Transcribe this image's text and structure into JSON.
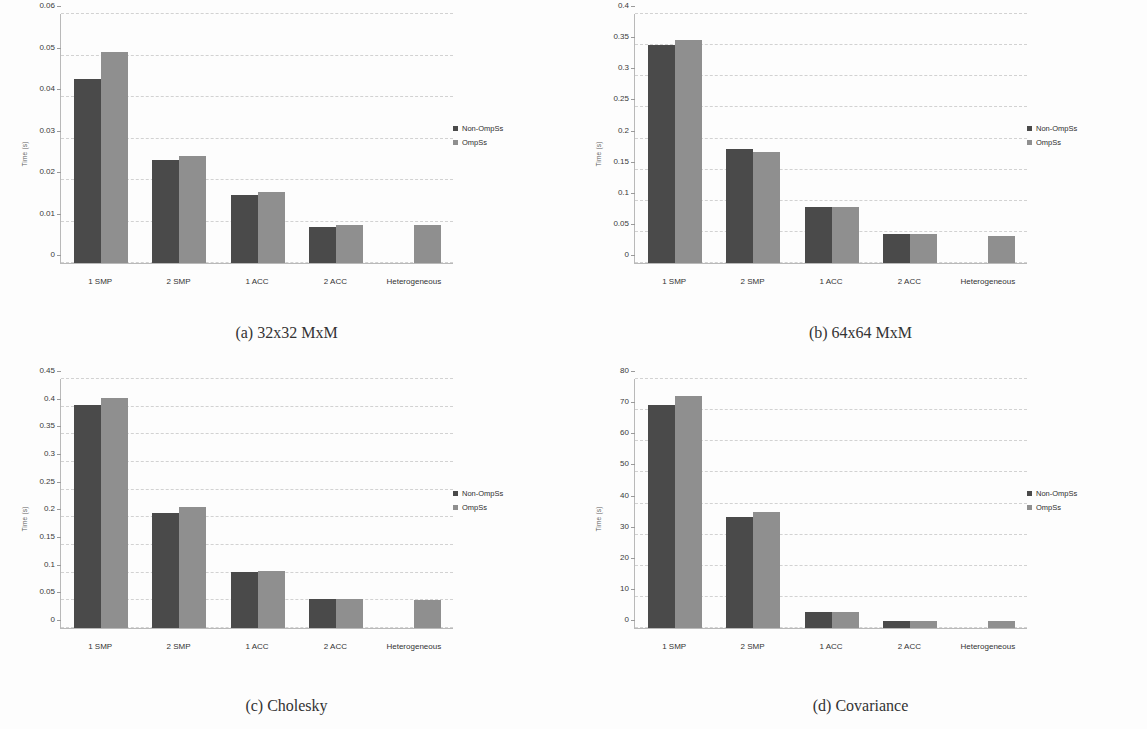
{
  "figure": {
    "colors": {
      "non_ompss": "#4a4a4a",
      "ompss": "#8f8f8f",
      "grid": "#d2d2d2",
      "axis": "#b9b9b9"
    },
    "legend": {
      "entries": [
        "Non-OmpSs",
        "OmpSs"
      ]
    },
    "ylabel": "Time (s)",
    "categories": [
      "1 SMP",
      "2 SMP",
      "1 ACC",
      "2 ACC",
      "Heterogeneous"
    ]
  },
  "panels": {
    "a": {
      "caption": "(a) 32x32 MxM",
      "yticks": [
        "0",
        "0.01",
        "0.02",
        "0.03",
        "0.04",
        "0.05",
        "0.06"
      ],
      "legend": [
        "Non-OmpSs",
        "OmpSs"
      ],
      "ylabel": "Time (s)",
      "categories": [
        "1 SMP",
        "2 SMP",
        "1 ACC",
        "2 ACC",
        "Heterogeneous"
      ]
    },
    "b": {
      "caption": "(b) 64x64 MxM",
      "yticks": [
        "0",
        "0.05",
        "0.1",
        "0.15",
        "0.2",
        "0.25",
        "0.3",
        "0.35",
        "0.4"
      ],
      "legend": [
        "Non-OmpSs",
        "OmpSs"
      ],
      "ylabel": "Time (s)",
      "categories": [
        "1 SMP",
        "2 SMP",
        "1 ACC",
        "2 ACC",
        "Heterogeneous"
      ]
    },
    "c": {
      "caption": "(c) Cholesky",
      "yticks": [
        "0",
        "0.05",
        "0.1",
        "0.15",
        "0.2",
        "0.25",
        "0.3",
        "0.35",
        "0.4",
        "0.45"
      ],
      "legend": [
        "Non-OmpSs",
        "OmpSs"
      ],
      "ylabel": "Time (s)",
      "categories": [
        "1 SMP",
        "2 SMP",
        "1 ACC",
        "2 ACC",
        "Heterogeneous"
      ]
    },
    "d": {
      "caption": "(d) Covariance",
      "yticks": [
        "0",
        "10",
        "20",
        "30",
        "40",
        "50",
        "60",
        "70",
        "80"
      ],
      "legend": [
        "Non-OmpSs",
        "OmpSs"
      ],
      "ylabel": "Time (s)",
      "categories": [
        "1 SMP",
        "2 SMP",
        "1 ACC",
        "2 ACC",
        "Heterogeneous"
      ]
    }
  },
  "chart_data": [
    {
      "id": "a",
      "type": "bar",
      "title": "(a) 32x32 MxM",
      "xlabel": "",
      "ylabel": "Time (s)",
      "ylim": [
        0,
        0.06
      ],
      "ytick_values": [
        0,
        0.01,
        0.02,
        0.03,
        0.04,
        0.05,
        0.06
      ],
      "grid": true,
      "legend_position": "right",
      "categories": [
        "1 SMP",
        "2 SMP",
        "1 ACC",
        "2 ACC",
        "Heterogeneous"
      ],
      "series": [
        {
          "name": "Non-OmpSs",
          "color": "#4a4a4a",
          "values": [
            0.0444,
            0.0248,
            0.0164,
            0.0086,
            null
          ]
        },
        {
          "name": "OmpSs",
          "color": "#8f8f8f",
          "values": [
            0.0509,
            0.0259,
            0.017,
            0.0092,
            0.0092
          ]
        }
      ]
    },
    {
      "id": "b",
      "type": "bar",
      "title": "(b) 64x64 MxM",
      "xlabel": "",
      "ylabel": "Time (s)",
      "ylim": [
        0,
        0.4
      ],
      "ytick_values": [
        0,
        0.05,
        0.1,
        0.15,
        0.2,
        0.25,
        0.3,
        0.35,
        0.4
      ],
      "grid": true,
      "legend_position": "right",
      "categories": [
        "1 SMP",
        "2 SMP",
        "1 ACC",
        "2 ACC",
        "Heterogeneous"
      ],
      "series": [
        {
          "name": "Non-OmpSs",
          "color": "#4a4a4a",
          "values": [
            0.351,
            0.183,
            0.0905,
            0.0465,
            null
          ]
        },
        {
          "name": "OmpSs",
          "color": "#8f8f8f",
          "values": [
            0.359,
            0.179,
            0.0905,
            0.0465,
            0.0435
          ]
        }
      ]
    },
    {
      "id": "c",
      "type": "bar",
      "title": "(c) Cholesky",
      "xlabel": "",
      "ylabel": "Time (s)",
      "ylim": [
        0,
        0.45
      ],
      "ytick_values": [
        0,
        0.05,
        0.1,
        0.15,
        0.2,
        0.25,
        0.3,
        0.35,
        0.4,
        0.45
      ],
      "grid": true,
      "legend_position": "right",
      "categories": [
        "1 SMP",
        "2 SMP",
        "1 ACC",
        "2 ACC",
        "Heterogeneous"
      ],
      "series": [
        {
          "name": "Non-OmpSs",
          "color": "#4a4a4a",
          "values": [
            0.403,
            0.207,
            0.101,
            0.0525,
            null
          ]
        },
        {
          "name": "OmpSs",
          "color": "#8f8f8f",
          "values": [
            0.416,
            0.218,
            0.1025,
            0.0525,
            0.0505
          ]
        }
      ]
    },
    {
      "id": "d",
      "type": "bar",
      "title": "(d) Covariance",
      "xlabel": "",
      "ylabel": "Time (s)",
      "ylim": [
        0,
        80
      ],
      "ytick_values": [
        0,
        10,
        20,
        30,
        40,
        50,
        60,
        70,
        80
      ],
      "grid": true,
      "legend_position": "right",
      "categories": [
        "1 SMP",
        "2 SMP",
        "1 ACC",
        "2 ACC",
        "Heterogeneous"
      ],
      "series": [
        {
          "name": "Non-OmpSs",
          "color": "#4a4a4a",
          "values": [
            71.5,
            35.8,
            5.0,
            2.4,
            null
          ]
        },
        {
          "name": "OmpSs",
          "color": "#8f8f8f",
          "values": [
            74.5,
            37.2,
            5.0,
            2.4,
            2.4
          ]
        }
      ]
    }
  ]
}
